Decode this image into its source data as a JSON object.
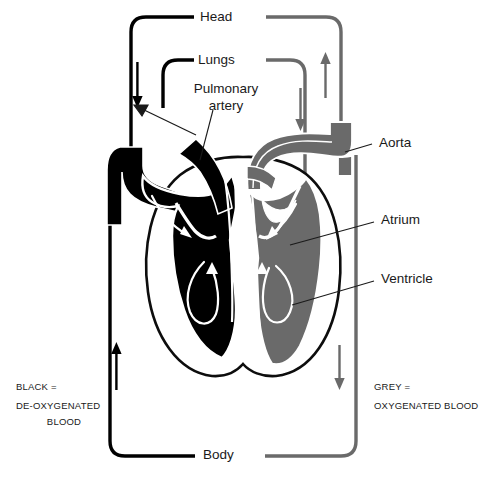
{
  "diagram": {
    "type": "anatomical-flow-diagram",
    "colors": {
      "deoxygenated": "#000000",
      "oxygenated": "#666666",
      "background": "#ffffff",
      "outline": "#ffffff",
      "text": "#1a1a1a"
    },
    "circuit_labels": {
      "head": "Head",
      "lungs": "Lungs",
      "body": "Body"
    },
    "structure_labels": {
      "pulmonary_artery": "Pulmonary\nartery",
      "pulmonary_artery_line1": "Pulmonary",
      "pulmonary_artery_line2": "artery",
      "aorta": "Aorta",
      "atrium": "Atrium",
      "ventricle": "Ventricle"
    },
    "legend": {
      "left": {
        "line1": "BLACK =",
        "line2": "DE-OXYGENATED",
        "line3": "BLOOD"
      },
      "right": {
        "line1": "GREY =",
        "line2": "OXYGENATED BLOOD"
      }
    },
    "caption_partial": ""
  }
}
